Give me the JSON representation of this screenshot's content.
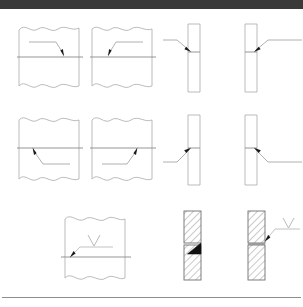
{
  "window": {
    "chrome_bar_text": "",
    "chrome_bar_color": "#3a3a3a"
  },
  "document": {
    "background_color": "#ffffff",
    "line_color": "#9c9c9c",
    "joint_line_color": "#8a8a8a",
    "arrow_color": "#1a1a1a",
    "hatch_color": "#8a8a8a",
    "weld_fill_color": "#111111",
    "rule_color": "#8d8d8d"
  },
  "figure": {
    "type": "welding-symbol-diagrams",
    "title": "",
    "rows": [
      {
        "row_index": 1,
        "cells": [
          {
            "id": "r1c1",
            "name": "plate-horizontal-joint-arrow-right",
            "orientation": "horizontal",
            "break_lines": "top-and-bottom",
            "joint_position": "middle",
            "leader_origin": "upper-left",
            "leader_direction": "down-right",
            "arrow_target": "joint-line-arrow-side",
            "weld_symbol": "none",
            "caption": ""
          },
          {
            "id": "r1c2",
            "name": "plate-horizontal-joint-arrow-left",
            "orientation": "horizontal",
            "break_lines": "top-and-bottom",
            "joint_position": "middle",
            "leader_origin": "upper-right",
            "leader_direction": "down-left",
            "arrow_target": "joint-line-arrow-side",
            "weld_symbol": "none",
            "caption": ""
          },
          {
            "id": "r1c3",
            "name": "plate-vertical-joint-arrow-from-left",
            "orientation": "vertical",
            "break_lines": "none",
            "joint_position": "upper-middle",
            "leader_origin": "left",
            "leader_direction": "down-right",
            "arrow_target": "joint-line-arrow-side",
            "weld_symbol": "none",
            "caption": ""
          },
          {
            "id": "r1c4",
            "name": "plate-vertical-joint-arrow-from-right",
            "orientation": "vertical",
            "break_lines": "none",
            "joint_position": "upper-middle",
            "leader_origin": "right",
            "leader_direction": "down-left",
            "arrow_target": "joint-line-arrow-side",
            "weld_symbol": "none",
            "caption": ""
          }
        ]
      },
      {
        "row_index": 2,
        "cells": [
          {
            "id": "r2c1",
            "name": "plate-horizontal-joint-arrow-up-left",
            "orientation": "horizontal",
            "break_lines": "top-and-bottom",
            "joint_position": "middle",
            "leader_origin": "lower-right",
            "leader_direction": "up-left",
            "arrow_target": "joint-line-other-side",
            "weld_symbol": "none",
            "caption": ""
          },
          {
            "id": "r2c2",
            "name": "plate-horizontal-joint-arrow-up-right",
            "orientation": "horizontal",
            "break_lines": "top-and-bottom",
            "joint_position": "middle",
            "leader_origin": "lower-left",
            "leader_direction": "up-right",
            "arrow_target": "joint-line-other-side",
            "weld_symbol": "none",
            "caption": ""
          },
          {
            "id": "r2c3",
            "name": "plate-vertical-joint-arrow-up-from-left",
            "orientation": "vertical",
            "break_lines": "none",
            "joint_position": "middle",
            "leader_origin": "lower-left",
            "leader_direction": "up-right",
            "arrow_target": "joint-line-other-side",
            "weld_symbol": "none",
            "caption": ""
          },
          {
            "id": "r2c4",
            "name": "plate-vertical-joint-arrow-up-from-right",
            "orientation": "vertical",
            "break_lines": "none",
            "joint_position": "middle",
            "leader_origin": "lower-right",
            "leader_direction": "up-left",
            "arrow_target": "joint-line-other-side",
            "weld_symbol": "none",
            "caption": ""
          }
        ]
      },
      {
        "row_index": 3,
        "cells": [
          {
            "id": "r3c1",
            "name": "plate-horizontal-joint-with-weld-symbol",
            "orientation": "horizontal",
            "break_lines": "top-and-bottom",
            "joint_position": "lower-middle",
            "leader_origin": "right",
            "leader_direction": "down-left",
            "arrow_target": "joint-line-arrow-side",
            "weld_symbol": "v-groove",
            "caption": ""
          },
          {
            "id": "r3c2",
            "name": "hatched-plate-with-filled-weld",
            "orientation": "vertical",
            "break_lines": "none",
            "joint_position": "middle",
            "hatching": "45-degree",
            "leader_origin": "none",
            "leader_direction": "none",
            "arrow_target": "none",
            "weld_symbol": "filled-triangle",
            "caption": ""
          },
          {
            "id": "r3c3",
            "name": "hatched-plate-with-leader-and-weld-symbol",
            "orientation": "vertical",
            "break_lines": "none",
            "joint_position": "middle",
            "hatching": "45-degree",
            "leader_origin": "upper-right",
            "leader_direction": "down-left",
            "arrow_target": "joint-line-arrow-side",
            "weld_symbol": "v-groove",
            "caption": ""
          }
        ]
      }
    ]
  }
}
